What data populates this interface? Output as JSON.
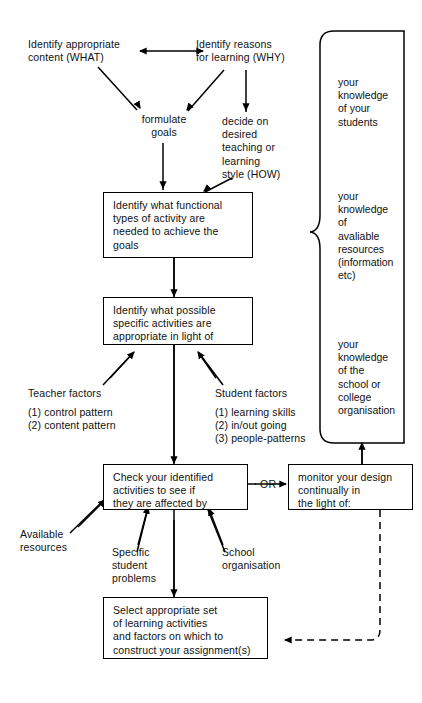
{
  "diagram": {
    "stroke_color": "#000000",
    "background_color": "#ffffff",
    "nodes": {
      "identify_content": "Identify appropriate\ncontent (WHAT)",
      "identify_reasons": "Identify reasons\nfor learning (WHY)",
      "formulate_goals": "formulate\ngoals",
      "decide_style": "decide on\ndesired\nteaching or\nlearning\nstyle (HOW)",
      "functional_types": "Identify what functional\ntypes of activity are\nneeded to achieve the\ngoals",
      "specific_activities": "Identify what possible\nspecific activities are\nappropriate in light of",
      "teacher_factors": "Teacher factors",
      "teacher_factor_1": "(1)  control pattern",
      "teacher_factor_2": "(2)  content pattern",
      "student_factors": "Student factors",
      "student_factor_1": "(1)  learning skills",
      "student_factor_2": "(2)  in/out going",
      "student_factor_3": "(3)  people-patterns",
      "check_activities": "Check your identified\nactivities to see if\nthey are affected by",
      "or_connector": "OR",
      "monitor_design": "monitor your design\ncontinually in\nthe light of:",
      "available_resources": "Available\nresources",
      "specific_student_problems": "Specific\nstudent\nproblems",
      "school_organisation": "School\norganisation",
      "select_set": "Select appropriate set\nof learning activities\nand factors on which to\nconstruct your assignment(s)"
    },
    "knowledge_panel": {
      "item_1": "your\nknowledge\nof your\nstudents",
      "item_2": "your\nknowledge\nof\navaliable\nresources\n(information\netc)",
      "item_3": "your\nknowledge\nof the\nschool or\ncollege\norganisation"
    }
  }
}
